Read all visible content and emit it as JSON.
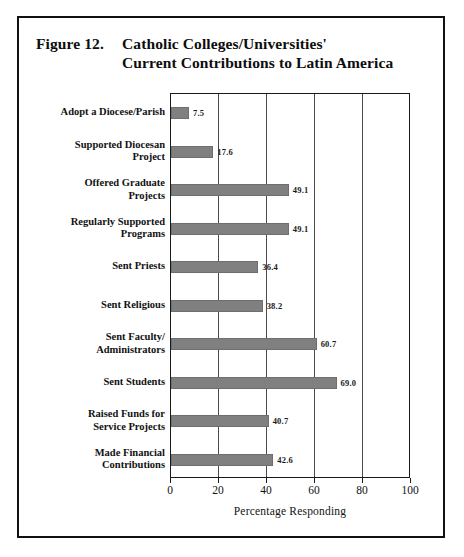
{
  "figure": {
    "number": "Figure 12.",
    "title_line1": "Catholic Colleges/Universities'",
    "title_line2": "Current Contributions to Latin America"
  },
  "chart_data": {
    "type": "bar",
    "orientation": "horizontal",
    "xlabel": "Percentage Responding",
    "ylabel": "",
    "xlim": [
      0,
      100
    ],
    "xticks": [
      0,
      20,
      40,
      60,
      80,
      100
    ],
    "grid": true,
    "legend": false,
    "bar_color": "#808080",
    "categories": [
      "Adopt a Diocese/Parish",
      "Supported Diocesan Project",
      "Offered Graduate Projects",
      "Regularly Supported Programs",
      "Sent Priests",
      "Sent Religious",
      "Sent Faculty/Administrators",
      "Sent Students",
      "Raised Funds for Service Projects",
      "Made Financial Contributions"
    ],
    "category_lines": [
      [
        "Adopt a Diocese/Parish"
      ],
      [
        "Supported Diocesan",
        "Project"
      ],
      [
        "Offered Graduate",
        "Projects"
      ],
      [
        "Regularly Supported",
        "Programs"
      ],
      [
        "Sent Priests"
      ],
      [
        "Sent Religious"
      ],
      [
        "Sent Faculty/",
        "Administrators"
      ],
      [
        "Sent Students"
      ],
      [
        "Raised Funds for",
        "Service Projects"
      ],
      [
        "Made Financial",
        "Contributions"
      ]
    ],
    "values": [
      7.5,
      17.6,
      49.1,
      49.1,
      36.4,
      38.2,
      60.7,
      69.0,
      40.7,
      42.6
    ],
    "value_labels": [
      "7.5",
      "17.6",
      "49.1",
      "49.1",
      "36.4",
      "38.2",
      "60.7",
      "69.0",
      "40.7",
      "42.6"
    ]
  },
  "axis": {
    "tick_labels": [
      "0",
      "20",
      "40",
      "60",
      "80",
      "100"
    ],
    "title": "Percentage Responding"
  }
}
